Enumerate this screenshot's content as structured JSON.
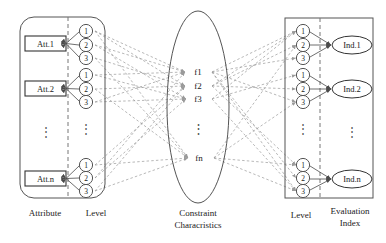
{
  "diagram": {
    "type": "tripartite-network-diagram",
    "colors": {
      "stroke": "#555555",
      "dashed": "#9a9a9a",
      "solid_edge": "#4a4a4a",
      "text": "#1a1a1a",
      "background": "#ffffff"
    },
    "left_panel": {
      "caption_attribute": "Attribute",
      "caption_level": "Level",
      "nodes": [
        {
          "box": "Att.1",
          "levels": [
            "1",
            "2",
            "3"
          ]
        },
        {
          "box": "Att.2",
          "levels": [
            "1",
            "2",
            "3"
          ]
        },
        {
          "box": "Att.n",
          "levels": [
            "1",
            "2",
            "3"
          ]
        }
      ],
      "ellipsis": "⋮"
    },
    "center_panel": {
      "caption_line1": "Constraint",
      "caption_line2": "Characristics",
      "items": [
        "f1",
        "f2",
        "f3",
        "fn"
      ],
      "ellipsis": "⋮"
    },
    "right_panel": {
      "caption_level": "Level",
      "caption_index_line1": "Evaluation",
      "caption_index_line2": "Index",
      "nodes": [
        {
          "levels": [
            "1",
            "2",
            "3"
          ],
          "oval": "Ind.1"
        },
        {
          "levels": [
            "1",
            "2",
            "3"
          ],
          "oval": "Ind.2"
        },
        {
          "levels": [
            "1",
            "2",
            "3"
          ],
          "oval": "Ind.n"
        }
      ],
      "ellipsis": "⋮"
    }
  }
}
